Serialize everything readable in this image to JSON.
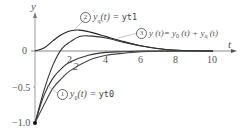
{
  "chart_data": {
    "type": "line",
    "title": "",
    "xlabel": "t",
    "ylabel": "y",
    "xlim": [
      0,
      11
    ],
    "ylim": [
      -1.0,
      0.45
    ],
    "x_ticks": [
      "2",
      "4",
      "6",
      "8",
      "10"
    ],
    "y_ticks": [
      "0",
      "-0.5",
      "-1.0"
    ],
    "grid": false,
    "legend_position": "inline-annotations",
    "series": [
      {
        "name": "y_0(t) = yt0",
        "annotation_number": "1",
        "x": [
          0,
          0.5,
          1,
          1.5,
          2,
          3,
          4,
          5,
          6,
          8,
          10
        ],
        "values": [
          -1.0,
          -0.62,
          -0.38,
          -0.24,
          -0.15,
          -0.06,
          -0.02,
          -0.01,
          0.0,
          0.0,
          0.0
        ]
      },
      {
        "name": "y_q(t) = yt1",
        "annotation_number": "2",
        "x": [
          0,
          0.5,
          1,
          1.5,
          2,
          2.5,
          3,
          4,
          5,
          6,
          7,
          8,
          10
        ],
        "values": [
          0.0,
          0.04,
          0.14,
          0.23,
          0.28,
          0.29,
          0.27,
          0.2,
          0.13,
          0.07,
          0.03,
          0.01,
          0.0
        ]
      },
      {
        "name": "y(t) = y_0(t) + y_q(t)",
        "annotation_number": "3",
        "x": [
          0,
          0.5,
          1,
          1.5,
          2,
          2.5,
          3,
          4,
          5,
          6,
          7,
          8,
          10
        ],
        "values": [
          -1.0,
          -0.55,
          -0.2,
          0.03,
          0.13,
          0.2,
          0.21,
          0.18,
          0.12,
          0.07,
          0.03,
          0.01,
          0.0
        ]
      },
      {
        "name": "unlabeled curve",
        "x": [
          0,
          0.5,
          1,
          1.5,
          2,
          3,
          4,
          5,
          6,
          8,
          10
        ],
        "values": [
          -1.0,
          -0.75,
          -0.52,
          -0.38,
          -0.27,
          -0.13,
          -0.06,
          -0.03,
          -0.01,
          0.0,
          0.0
        ]
      }
    ],
    "annotations": [
      {
        "number": "1",
        "text": "y_0(t) = yt0"
      },
      {
        "number": "2",
        "text": "y_q(t) = yt1"
      },
      {
        "number": "3",
        "text": "y(t) = y_0(t) + y_q(t)"
      },
      {
        "text": "2",
        "note": "small numeral near curve at t≈2"
      }
    ]
  },
  "labels": {
    "y_axis": "y",
    "x_axis": "t",
    "origin": "0",
    "tick_x": [
      "2",
      "4",
      "6",
      "8",
      "10"
    ],
    "tick_y_neg05": "−0.5",
    "tick_y_neg10": "−1.0",
    "ann1_num": "1",
    "ann1_text": "y",
    "ann1_sub": "0",
    "ann1_rest": "(t) = ",
    "ann1_code": "yt0",
    "ann2_num": "2",
    "ann2_text": "y",
    "ann2_sub": "q",
    "ann2_rest": "(t) = ",
    "ann2_code": "yt1",
    "ann3_num": "3",
    "ann3_text": "y (t)= y",
    "ann3_sub1": "0",
    "ann3_mid": " (t) + y",
    "ann3_sub2": "q",
    "ann3_rest": " (t)",
    "curve_numeral": "2"
  }
}
